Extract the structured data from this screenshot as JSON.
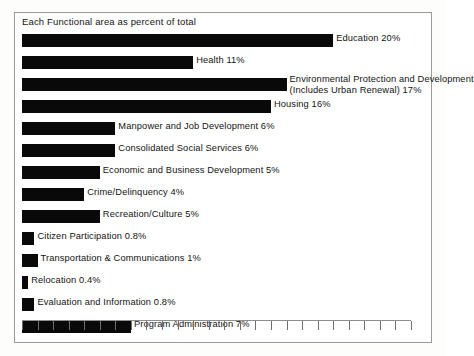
{
  "figure": {
    "caption": "Each Functional area as percent of total",
    "frame_color": "#9a9a98",
    "bar_color": "#090909",
    "text_color": "#131313"
  },
  "axis": {
    "tick_count": 25,
    "tick_interval_percent": 1,
    "min": 0,
    "max": 25,
    "labels_shown": false
  },
  "chart_data": {
    "type": "bar",
    "orientation": "horizontal",
    "title": "Each Functional area as percent of total",
    "xlabel": "",
    "ylabel": "",
    "xlim": [
      0,
      25
    ],
    "grid": false,
    "legend": false,
    "unit": "percent",
    "categories": [
      "Education",
      "Health",
      "Environmental Protection and Development (Includes Urban Renewal)",
      "Housing",
      "Manpower and Job Development",
      "Consolidated Social Services",
      "Economic and Business Development",
      "Crime/Delinquency",
      "Recreation/Culture",
      "Citizen Participation",
      "Transportation & Communications",
      "Relocation",
      "Evaluation and Information",
      "Program Administration"
    ],
    "values": [
      20,
      11,
      17,
      16,
      6,
      6,
      5,
      4,
      5,
      0.8,
      1,
      0.4,
      0.8,
      7
    ],
    "value_labels": [
      "20%",
      "11%",
      "17%",
      "16%",
      "6%",
      "6%",
      "5%",
      "4%",
      "5%",
      "0.8%",
      "1%",
      "0.4%",
      "0.8%",
      "7%"
    ]
  },
  "bars": [
    {
      "label_line1": "Education 20%",
      "label_line2": "",
      "value": 20,
      "value_label": "20%",
      "name": "education"
    },
    {
      "label_line1": "Health 11%",
      "label_line2": "",
      "value": 11,
      "value_label": "11%",
      "name": "health"
    },
    {
      "label_line1": "Environmental Protection and Development",
      "label_line2": "(Includes Urban Renewal)  17%",
      "value": 17,
      "value_label": "17%",
      "name": "environmental-protection-and-development"
    },
    {
      "label_line1": "Housing 16%",
      "label_line2": "",
      "value": 16,
      "value_label": "16%",
      "name": "housing"
    },
    {
      "label_line1": "Manpower and Job Development 6%",
      "label_line2": "",
      "value": 6,
      "value_label": "6%",
      "name": "manpower-and-job-development"
    },
    {
      "label_line1": "Consolidated Social Services  6%",
      "label_line2": "",
      "value": 6,
      "value_label": "6%",
      "name": "consolidated-social-services"
    },
    {
      "label_line1": "Economic and Business Development  5%",
      "label_line2": "",
      "value": 5,
      "value_label": "5%",
      "name": "economic-and-business-development"
    },
    {
      "label_line1": "Crime/Delinquency  4%",
      "label_line2": "",
      "value": 4,
      "value_label": "4%",
      "name": "crime-delinquency"
    },
    {
      "label_line1": "Recreation/Culture  5%",
      "label_line2": "",
      "value": 5,
      "value_label": "5%",
      "name": "recreation-culture"
    },
    {
      "label_line1": "Citizen Participation  0.8%",
      "label_line2": "",
      "value": 0.8,
      "value_label": "0.8%",
      "name": "citizen-participation"
    },
    {
      "label_line1": "Transportation & Communications  1%",
      "label_line2": "",
      "value": 1,
      "value_label": "1%",
      "name": "transportation-and-communications"
    },
    {
      "label_line1": "Relocation  0.4%",
      "label_line2": "",
      "value": 0.4,
      "value_label": "0.4%",
      "name": "relocation"
    },
    {
      "label_line1": "Evaluation and Information  0.8%",
      "label_line2": "",
      "value": 0.8,
      "value_label": "0.8%",
      "name": "evaluation-and-information"
    },
    {
      "label_line1": "Program Administration  7%",
      "label_line2": "",
      "value": 7,
      "value_label": "7%",
      "name": "program-administration"
    }
  ]
}
